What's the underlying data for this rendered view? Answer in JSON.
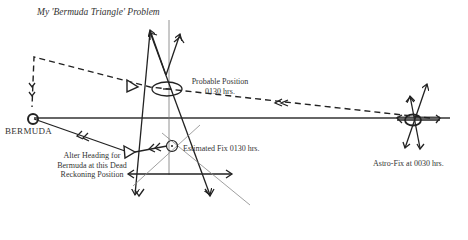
{
  "title": "My 'Bermuda Triangle' Problem",
  "labels": {
    "bermuda": "BERMUDA",
    "probable_position_line1": "Probable Position",
    "probable_position_line2": "0130 hrs.",
    "estimated_fix": "Estimated Fix 0130 hrs.",
    "alter_heading_line1": "Alter Heading for",
    "alter_heading_line2": "Bermuda at this Dead",
    "alter_heading_line3": "Reckoning Position",
    "astro_fix": "Astro-Fix at 0030 hrs."
  },
  "colors": {
    "ink": "#222222",
    "thin_line": "#666666",
    "background": "#ffffff"
  }
}
